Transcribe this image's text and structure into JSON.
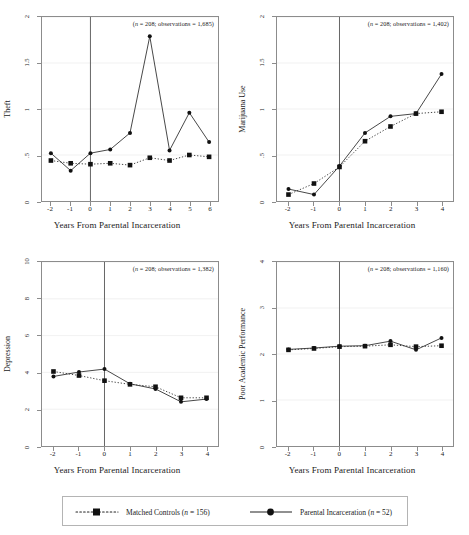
{
  "figure": {
    "xlabel": "Years From Parental Incarceration",
    "legend": {
      "entries": [
        {
          "label": "Matched Controls (n = 156)",
          "style": "dotted",
          "name": "matched-controls"
        },
        {
          "label": "Parental Incarceration (n = 52)",
          "style": "solid",
          "name": "parental-incarceration"
        }
      ]
    }
  },
  "chart_data": [
    {
      "type": "line",
      "title": "Theft",
      "ylabel": "Theft",
      "xlabel": "Years From Parental Incarceration",
      "annotation": "(n = 208; observations = 1,685)",
      "x": [
        -2,
        -1,
        0,
        1,
        2,
        3,
        4,
        5,
        6
      ],
      "xticklabels": [
        "-2",
        "-1",
        "0",
        "1",
        "2",
        "3",
        "4",
        "5",
        "6"
      ],
      "yticklabels": [
        "0",
        ".5",
        "1",
        "1.5",
        "2"
      ],
      "yticks": [
        0,
        0.5,
        1,
        1.5,
        2
      ],
      "xlim": [
        -2.45,
        6.45
      ],
      "ylim": [
        0,
        2
      ],
      "grid": true,
      "vline": 0,
      "series": [
        {
          "name": "Parental Incarceration",
          "style": "solid",
          "values": [
            0.52,
            0.33,
            0.52,
            0.56,
            0.74,
            1.79,
            0.55,
            0.96,
            0.64
          ]
        },
        {
          "name": "Matched Controls",
          "style": "dotted",
          "values": [
            0.44,
            0.41,
            0.4,
            0.41,
            0.39,
            0.47,
            0.44,
            0.5,
            0.48
          ]
        }
      ]
    },
    {
      "type": "line",
      "title": "Marijuana Use",
      "ylabel": "Marijuana Use",
      "xlabel": "Years From Parental Incarceration",
      "annotation": "(n = 208; observations = 1,402)",
      "x": [
        -2,
        -1,
        0,
        1,
        2,
        3,
        4
      ],
      "xticklabels": [
        "-2",
        "-1",
        "0",
        "1",
        "2",
        "3",
        "4"
      ],
      "yticklabels": [
        "0",
        ".5",
        "1",
        "1.5",
        "2"
      ],
      "yticks": [
        0,
        0.5,
        1,
        1.5,
        2
      ],
      "xlim": [
        -2.45,
        4.45
      ],
      "ylim": [
        0,
        2
      ],
      "grid": true,
      "vline": 0,
      "series": [
        {
          "name": "Parental Incarceration",
          "style": "solid",
          "values": [
            0.13,
            0.07,
            0.38,
            0.74,
            0.92,
            0.95,
            1.38
          ]
        },
        {
          "name": "Matched Controls",
          "style": "dotted",
          "values": [
            0.07,
            0.19,
            0.37,
            0.65,
            0.81,
            0.95,
            0.97
          ]
        }
      ]
    },
    {
      "type": "line",
      "title": "Depression",
      "ylabel": "Depression",
      "xlabel": "Years From Parental Incarceration",
      "annotation": "(n = 208; observations = 1,382)",
      "x": [
        -2,
        -1,
        0,
        1,
        2,
        3,
        4
      ],
      "xticklabels": [
        "-2",
        "-1",
        "0",
        "1",
        "2",
        "3",
        "4"
      ],
      "yticklabels": [
        "0",
        "2",
        "4",
        "6",
        "8",
        "10"
      ],
      "yticks": [
        0,
        2,
        4,
        6,
        8,
        10
      ],
      "xlim": [
        -2.45,
        4.45
      ],
      "ylim": [
        0,
        10
      ],
      "grid": true,
      "vline": 0,
      "series": [
        {
          "name": "Parental Incarceration",
          "style": "solid",
          "values": [
            3.78,
            4.02,
            4.18,
            3.38,
            3.1,
            2.4,
            2.55
          ]
        },
        {
          "name": "Matched Controls",
          "style": "dotted",
          "values": [
            4.05,
            3.83,
            3.55,
            3.35,
            3.22,
            2.62,
            2.62
          ]
        }
      ]
    },
    {
      "type": "line",
      "title": "Poor Academic Performance",
      "ylabel": "Poor Academic Performance",
      "xlabel": "Years From Parental Incarceration",
      "annotation": "(n = 208; observations = 1,160)",
      "x": [
        -2,
        -1,
        0,
        1,
        2,
        3,
        4
      ],
      "xticklabels": [
        "-2",
        "-1",
        "0",
        "1",
        "2",
        "3",
        "4"
      ],
      "yticklabels": [
        "0",
        "1",
        "2",
        "3",
        "4"
      ],
      "yticks": [
        0,
        1,
        2,
        3,
        4
      ],
      "xlim": [
        -2.45,
        4.45
      ],
      "ylim": [
        0,
        4
      ],
      "grid": true,
      "vline": 0,
      "series": [
        {
          "name": "Parental Incarceration",
          "style": "solid",
          "values": [
            2.1,
            2.13,
            2.17,
            2.18,
            2.28,
            2.09,
            2.35
          ]
        },
        {
          "name": "Matched Controls",
          "style": "dotted",
          "values": [
            2.09,
            2.12,
            2.16,
            2.17,
            2.2,
            2.16,
            2.18
          ]
        }
      ]
    }
  ],
  "colors": {
    "line": "#333333",
    "marker": "#111111",
    "axis": "#8c8c8c",
    "grid": "#ededed",
    "vline": "#555555",
    "background": "#ffffff"
  }
}
